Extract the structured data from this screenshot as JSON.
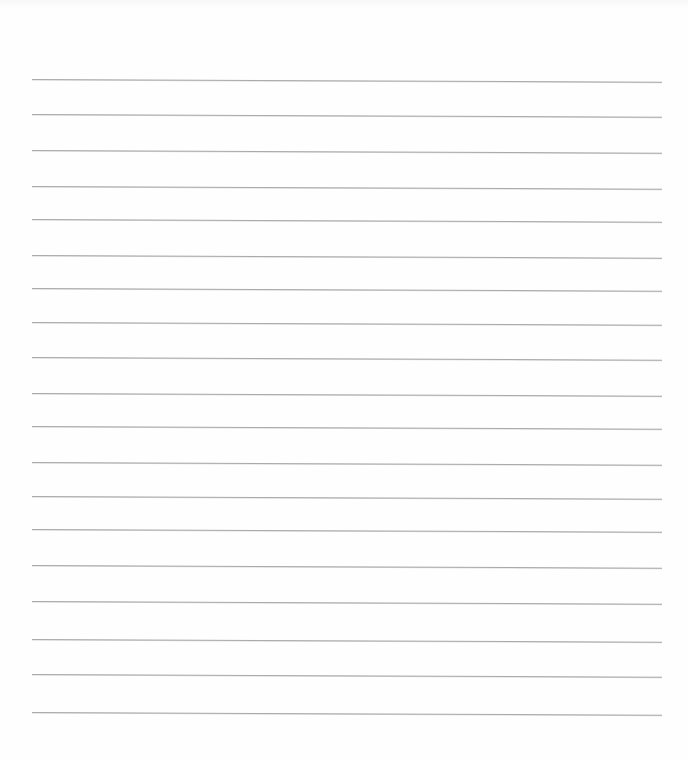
{
  "document": {
    "type": "lined-paper",
    "background_color": "#fefefe",
    "rule_color": "#a9a9a9",
    "rule_left_x": 32,
    "rule_right_x": 662,
    "rule_count": 19,
    "rules_y": [
      79,
      114,
      150,
      186,
      219,
      255,
      288,
      322,
      357,
      393,
      426,
      462,
      496,
      529,
      565,
      601,
      639,
      674,
      712
    ]
  }
}
